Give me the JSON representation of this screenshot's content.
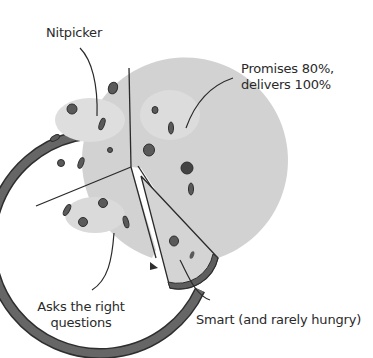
{
  "diagram": {
    "type": "pizza-pie",
    "colors": {
      "crust": "#5e5e5e",
      "crust_outline": "#2e2e2e",
      "cheese": "#cfcfcf",
      "cheese_light": "#dcdcdc",
      "topping": "#5a5a5a",
      "line": "#2a2a2a"
    },
    "labels": {
      "nitpicker": "Nitpicker",
      "promises_line1": "Promises 80%,",
      "promises_line2": "delivers 100%",
      "asks_line1": "Asks the right",
      "asks_line2": "questions",
      "smart": "Smart (and rarely hungry)"
    },
    "slices": [
      {
        "name": "Nitpicker"
      },
      {
        "name": "Promises 80%, delivers 100%"
      },
      {
        "name": "Asks the right questions"
      },
      {
        "name": "Smart (and rarely hungry)",
        "detached": true
      }
    ]
  }
}
